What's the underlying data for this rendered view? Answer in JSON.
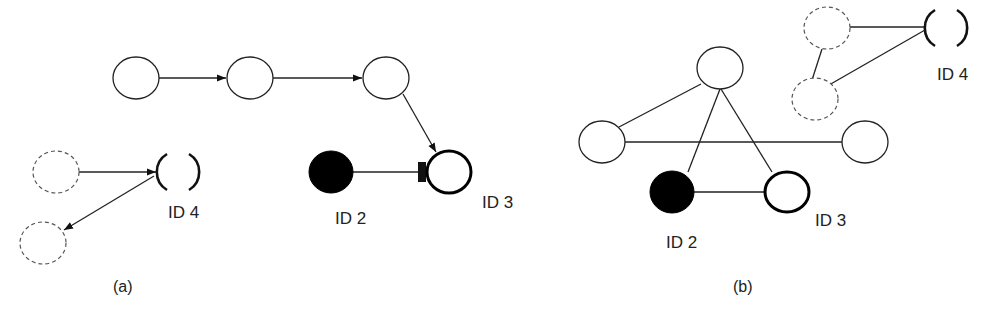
{
  "panels": [
    {
      "id": "a",
      "caption": "(a)",
      "type": "directed-graph",
      "nodes": [
        {
          "key": "a-n1",
          "style": "plain"
        },
        {
          "key": "a-n2",
          "style": "plain"
        },
        {
          "key": "a-n3",
          "style": "plain"
        },
        {
          "key": "a-d1",
          "style": "dashed"
        },
        {
          "key": "a-d2",
          "style": "dashed"
        },
        {
          "key": "a-id4",
          "style": "broken",
          "label": "ID 4"
        },
        {
          "key": "a-id2",
          "style": "filled",
          "label": "ID 2"
        },
        {
          "key": "a-id3",
          "style": "thick",
          "label": "ID 3"
        }
      ],
      "edges": [
        {
          "from": "a-n1",
          "to": "a-n2",
          "kind": "arrow"
        },
        {
          "from": "a-n2",
          "to": "a-n3",
          "kind": "arrow"
        },
        {
          "from": "a-n3",
          "to": "a-id3",
          "kind": "arrow"
        },
        {
          "from": "a-d1",
          "to": "a-id4",
          "kind": "arrow"
        },
        {
          "from": "a-id4",
          "to": "a-d2",
          "kind": "arrow"
        },
        {
          "from": "a-id2",
          "to": "a-id3",
          "kind": "blocked-square"
        }
      ]
    },
    {
      "id": "b",
      "caption": "(b)",
      "type": "undirected-graph",
      "nodes": [
        {
          "key": "b-top",
          "style": "plain"
        },
        {
          "key": "b-left",
          "style": "plain"
        },
        {
          "key": "b-right",
          "style": "plain"
        },
        {
          "key": "b-id2",
          "style": "filled",
          "label": "ID 2"
        },
        {
          "key": "b-id3",
          "style": "thick",
          "label": "ID 3"
        },
        {
          "key": "b-d1",
          "style": "dashed"
        },
        {
          "key": "b-d2",
          "style": "dashed"
        },
        {
          "key": "b-id4",
          "style": "broken",
          "label": "ID 4"
        }
      ],
      "edges": [
        {
          "from": "b-top",
          "to": "b-left"
        },
        {
          "from": "b-top",
          "to": "b-id2"
        },
        {
          "from": "b-top",
          "to": "b-id3"
        },
        {
          "from": "b-left",
          "to": "b-right"
        },
        {
          "from": "b-id2",
          "to": "b-id3"
        },
        {
          "from": "b-d1",
          "to": "b-id4"
        },
        {
          "from": "b-d2",
          "to": "b-id4"
        },
        {
          "from": "b-d1",
          "to": "b-d2"
        }
      ]
    }
  ],
  "labels": {
    "a_id4": "ID 4",
    "a_id2": "ID 2",
    "a_id3": "ID 3",
    "a_caption": "(a)",
    "b_id4": "ID 4",
    "b_id2": "ID 2",
    "b_id3": "ID 3",
    "b_caption": "(b)"
  },
  "colors": {
    "stroke": "#1a1a1a",
    "dashed": "#555555",
    "fill_filled": "#000000",
    "background": "#ffffff"
  }
}
